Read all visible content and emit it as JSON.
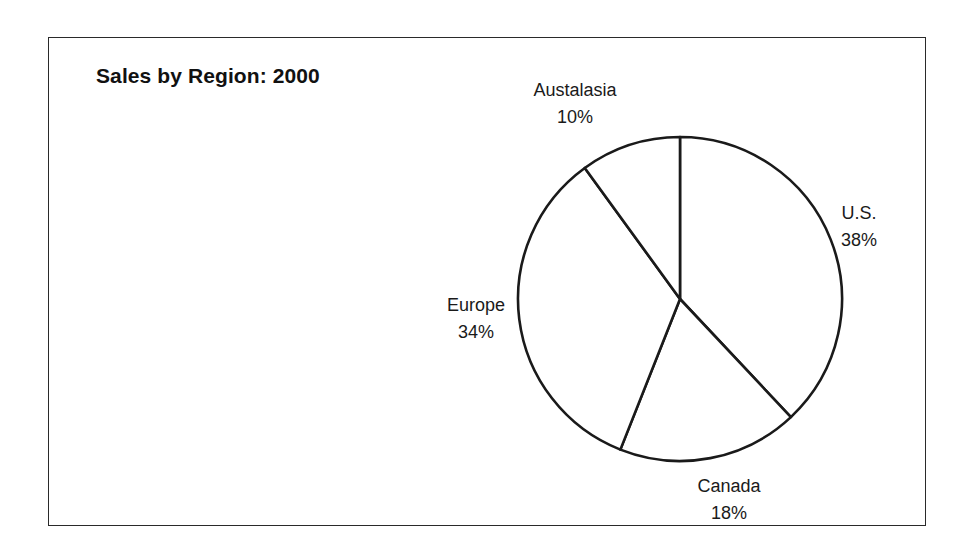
{
  "chart": {
    "title": "Sales by Region: 2000"
  },
  "chart_data": {
    "type": "pie",
    "title": "Sales by Region: 2000",
    "categories": [
      "U.S.",
      "Canada",
      "Europe",
      "Austalasia"
    ],
    "values": [
      38,
      18,
      34,
      10
    ],
    "unit": "%",
    "start_angle_deg": 0,
    "direction": "clockwise",
    "labels": [
      {
        "name": "U.S.",
        "pct": "38%"
      },
      {
        "name": "Canada",
        "pct": "18%"
      },
      {
        "name": "Europe",
        "pct": "34%"
      },
      {
        "name": "Austalasia",
        "pct": "10%"
      }
    ],
    "legend": "none",
    "grid": false,
    "fill": "#ffffff",
    "stroke": "#1a1a1a"
  }
}
